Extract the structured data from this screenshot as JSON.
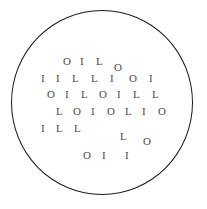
{
  "chart": {
    "shape": "circle",
    "background_color": "#ffffff",
    "border_color": "#1c1c1c",
    "letter_color": "#4a4a4a",
    "alphabet": [
      "O",
      "I",
      "L"
    ],
    "rows": [
      {
        "row_index": 1,
        "text": "O I L O",
        "glyphs": [
          {
            "char": "O",
            "x": 63,
            "y": 56
          },
          {
            "char": "I",
            "x": 80,
            "y": 56
          },
          {
            "char": "L",
            "x": 96,
            "y": 56
          },
          {
            "char": "O",
            "x": 114,
            "y": 62
          }
        ]
      },
      {
        "row_index": 2,
        "text": "I L L I O I",
        "glyphs": [
          {
            "char": "I",
            "x": 41,
            "y": 73
          },
          {
            "char": "I",
            "x": 56,
            "y": 73
          },
          {
            "char": "L",
            "x": 72,
            "y": 73
          },
          {
            "char": "L",
            "x": 91,
            "y": 73
          },
          {
            "char": "I",
            "x": 110,
            "y": 73
          },
          {
            "char": "O",
            "x": 129,
            "y": 73
          },
          {
            "char": "I",
            "x": 149,
            "y": 73
          }
        ]
      },
      {
        "row_index": 3,
        "text": "O I L O I L L",
        "glyphs": [
          {
            "char": "O",
            "x": 47,
            "y": 89
          },
          {
            "char": "I",
            "x": 65,
            "y": 89
          },
          {
            "char": "L",
            "x": 81,
            "y": 89
          },
          {
            "char": "O",
            "x": 99,
            "y": 89
          },
          {
            "char": "I",
            "x": 117,
            "y": 89
          },
          {
            "char": "L",
            "x": 133,
            "y": 89
          },
          {
            "char": "L",
            "x": 152,
            "y": 89
          }
        ]
      },
      {
        "row_index": 4,
        "text": "L O I O L I O",
        "glyphs": [
          {
            "char": "L",
            "x": 56,
            "y": 106
          },
          {
            "char": "O",
            "x": 73,
            "y": 106
          },
          {
            "char": "I",
            "x": 91,
            "y": 106
          },
          {
            "char": "O",
            "x": 107,
            "y": 106
          },
          {
            "char": "L",
            "x": 125,
            "y": 106
          },
          {
            "char": "I",
            "x": 142,
            "y": 106
          },
          {
            "char": "O",
            "x": 158,
            "y": 106
          }
        ]
      },
      {
        "row_index": 5,
        "text": "I L L L O",
        "glyphs": [
          {
            "char": "I",
            "x": 41,
            "y": 123
          },
          {
            "char": "I",
            "x": 41,
            "y": 123,
            "skip": true
          },
          {
            "char": "L",
            "x": 56,
            "y": 123
          },
          {
            "char": "L",
            "x": 74,
            "y": 123
          },
          {
            "char": "L",
            "x": 120,
            "y": 131
          },
          {
            "char": "O",
            "x": 143,
            "y": 136
          }
        ]
      },
      {
        "row_index": 6,
        "text": "O I I",
        "glyphs": [
          {
            "char": "O",
            "x": 83,
            "y": 150
          },
          {
            "char": "I",
            "x": 102,
            "y": 150
          },
          {
            "char": "I",
            "x": 125,
            "y": 150
          }
        ]
      }
    ]
  }
}
